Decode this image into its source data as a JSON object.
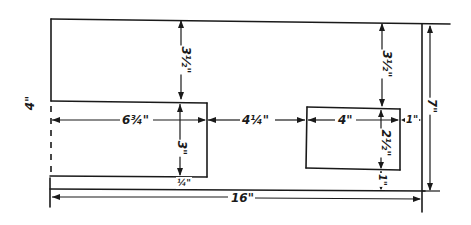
{
  "drawing": {
    "title": "Wall elevation with window openings (dimension sketch)",
    "units": "inches",
    "line_color": "#1a1a1a",
    "background": "#ffffff",
    "dimensions": {
      "overall_width": "16\"",
      "overall_height": "7\"",
      "left_height": "4\"",
      "left_opening_width": "6¾\"",
      "gap_between_openings": "4¼\"",
      "right_opening_width": "4\"",
      "right_margin": "1\"",
      "top_to_left_opening": "3½\"",
      "left_opening_height": "3\"",
      "left_bottom_margin": "¼\"",
      "top_to_right_opening": "3½\"",
      "right_opening_height": "2½\"",
      "right_bottom_margin": "1\""
    }
  }
}
